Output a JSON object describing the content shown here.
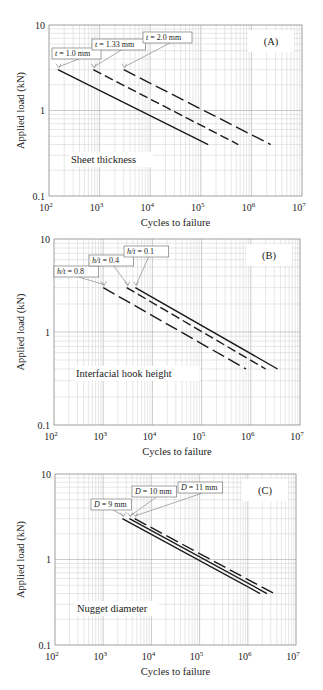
{
  "chart_data": [
    {
      "type": "line",
      "panel": "(A)",
      "annotation": "Sheet thickness",
      "xlabel": "Cycles to failure",
      "ylabel": "Applied load (kN)",
      "xscale": "log",
      "yscale": "log",
      "xlim": [
        100,
        10000000
      ],
      "ylim": [
        0.1,
        10
      ],
      "xticks": [
        "10^2",
        "10^3",
        "10^4",
        "10^5",
        "10^6",
        "10^7"
      ],
      "yticks": [
        "0.1",
        "1",
        "10"
      ],
      "grid": true,
      "frame": {
        "left": 49,
        "right": 302,
        "top": 25,
        "bottom": 196
      },
      "series": [
        {
          "name": "t = 1.0 mm",
          "style": "solid",
          "x": [
            150,
            140000
          ],
          "y": [
            3.0,
            0.4
          ],
          "label_box": [
            52,
            48
          ],
          "arrow_to_start": true
        },
        {
          "name": "t = 1.33 mm",
          "style": "dash",
          "x": [
            750,
            550000
          ],
          "y": [
            3.0,
            0.4
          ],
          "label_box": [
            92,
            39
          ],
          "arrow_to_start": true
        },
        {
          "name": "t = 2.0 mm",
          "style": "longdash",
          "x": [
            3000,
            2400000
          ],
          "y": [
            3.0,
            0.4
          ],
          "label_box": [
            143,
            32
          ],
          "arrow_to_start": true
        }
      ]
    },
    {
      "type": "line",
      "panel": "(B)",
      "annotation": "Interfacial hook height",
      "xlabel": "Cycles to failure",
      "ylabel": "Applied load (kN)",
      "xscale": "log",
      "yscale": "log",
      "xlim": [
        100,
        10000000
      ],
      "ylim": [
        0.1,
        10
      ],
      "xticks": [
        "10^2",
        "10^3",
        "10^4",
        "10^5",
        "10^6",
        "10^7"
      ],
      "yticks": [
        "0.1",
        "1",
        "10"
      ],
      "grid": true,
      "frame": {
        "left": 54,
        "right": 300,
        "top": 239,
        "bottom": 425
      },
      "series": [
        {
          "name": "h/t = 0.8",
          "style": "longdash",
          "x": [
            1000,
            800000
          ],
          "y": [
            3.0,
            0.4
          ],
          "label_box": [
            54,
            266
          ],
          "arrow_to_start": true
        },
        {
          "name": "h/t = 0.4",
          "style": "dash",
          "x": [
            3000,
            2000000
          ],
          "y": [
            3.0,
            0.4
          ],
          "label_box": [
            89,
            255
          ],
          "arrow_to_start": true
        },
        {
          "name": "h/t = 0.1",
          "style": "solid",
          "x": [
            4500,
            3500000
          ],
          "y": [
            3.0,
            0.4
          ],
          "label_box": [
            124,
            246
          ],
          "arrow_to_start": true
        }
      ]
    },
    {
      "type": "line",
      "panel": "(C)",
      "annotation": "Nugget diameter",
      "xlabel": "Cycles to failure",
      "ylabel": "Applied load (kN)",
      "xscale": "log",
      "yscale": "log",
      "xlim": [
        100,
        10000000
      ],
      "ylim": [
        0.1,
        10
      ],
      "xticks": [
        "10^2",
        "10^3",
        "10^4",
        "10^5",
        "10^6",
        "10^7"
      ],
      "yticks": [
        "0.1",
        "1",
        "10"
      ],
      "grid": true,
      "frame": {
        "left": 55,
        "right": 296,
        "top": 474,
        "bottom": 645
      },
      "series": [
        {
          "name": "D = 9 mm",
          "style": "solid",
          "x": [
            2500,
            1800000
          ],
          "y": [
            3.0,
            0.4
          ],
          "label_box": [
            91,
            499
          ],
          "arrow_to_start": true
        },
        {
          "name": "D = 10 mm",
          "style": "solid",
          "x": [
            3500,
            2500000
          ],
          "y": [
            3.0,
            0.4
          ],
          "label_box": [
            132,
            486
          ],
          "arrow_to_start": true
        },
        {
          "name": "D = 11 mm",
          "style": "longdash",
          "x": [
            4500,
            3500000
          ],
          "y": [
            3.0,
            0.4
          ],
          "label_box": [
            178,
            482
          ],
          "arrow_to_start": true
        }
      ]
    }
  ]
}
